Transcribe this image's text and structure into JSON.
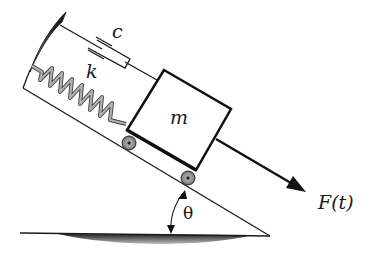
{
  "figure": {
    "type": "mechanical-system-schematic",
    "labels": {
      "damper": "c",
      "spring": "k",
      "mass": "m",
      "force": "F(t)",
      "angle": "θ"
    },
    "colors": {
      "line": "#1a1a1a",
      "spring": "#9a9a9a",
      "wall_shading": "#3a3a3a",
      "ground_shading": "#555555",
      "background": "#ffffff"
    },
    "components": [
      "wall",
      "dashpot",
      "spring",
      "mass",
      "rollers",
      "incline",
      "ground",
      "force-arrow",
      "angle-arc"
    ]
  }
}
